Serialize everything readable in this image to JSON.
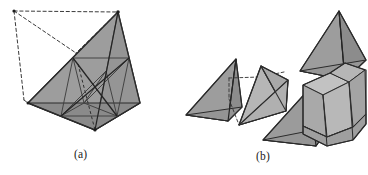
{
  "figure": {
    "background_color": "#ffffff",
    "panels": [
      {
        "id": "a",
        "caption": "(a)",
        "description": "Tetrahedron subdivided into four corner tetrahedra and a central octahedron, shown assembled inside a dashed wireframe bounding tetrahedron"
      },
      {
        "id": "b",
        "caption": "(b)",
        "description": "Exploded view of the subdivision: four corner tetrahedra and one octahedron separated apart"
      }
    ],
    "colors": {
      "solid_fill_dark": "#9a9a9a",
      "solid_fill_mid": "#a5a5a5",
      "solid_fill_light": "#b4b4b4",
      "solid_fill_lighter": "#bdbdbd",
      "edge_stroke": "#2b2b2b",
      "interior_stroke": "#4a4a4a",
      "dashed_stroke": "#3a3a3a",
      "caption_text": "#1a1a1a"
    },
    "geometry": {
      "panel_a": {
        "solid_tetrahedron_vertices": {
          "apex": [
            118,
            12
          ],
          "left": [
            28,
            103
          ],
          "right": [
            140,
            103
          ],
          "front": [
            95,
            130
          ]
        },
        "wireframe_tetrahedron_vertices": {
          "apex": [
            118,
            12
          ],
          "top_left": [
            14,
            11
          ],
          "left": [
            24,
            100
          ],
          "mid": [
            76,
            53
          ]
        },
        "edge_midpoints": {
          "apex_left": [
            73,
            58
          ],
          "apex_right": [
            129,
            58
          ],
          "apex_front": [
            106,
            71
          ],
          "left_right": [
            84,
            103
          ],
          "left_front": [
            61,
            116
          ],
          "right_front": [
            117,
            116
          ]
        }
      },
      "panel_b": {
        "pieces": [
          {
            "name": "corner-tetrahedron-left",
            "fill": "#9a9a9a"
          },
          {
            "name": "corner-tetrahedron-middle",
            "fill": "#b4b4b4"
          },
          {
            "name": "corner-tetrahedron-front",
            "fill": "#a5a5a5"
          },
          {
            "name": "corner-tetrahedron-top-right",
            "fill": "#9a9a9a"
          },
          {
            "name": "central-octahedron",
            "fill": "#bdbdbd"
          }
        ]
      }
    }
  }
}
